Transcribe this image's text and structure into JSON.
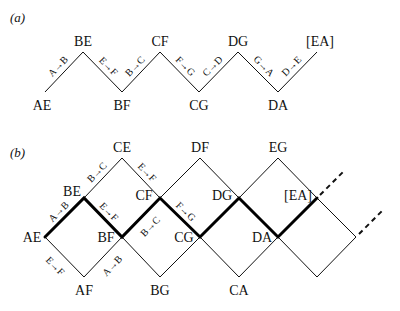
{
  "panel_a": {
    "label": "(a)",
    "nodes": [
      {
        "id": "AE",
        "label": "AE",
        "x": 45,
        "y": 92,
        "lx": 42,
        "ly": 110
      },
      {
        "id": "BE",
        "label": "BE",
        "x": 83,
        "y": 52,
        "lx": 83,
        "ly": 46
      },
      {
        "id": "BF",
        "label": "BF",
        "x": 122,
        "y": 92,
        "lx": 122,
        "ly": 110
      },
      {
        "id": "CF",
        "label": "CF",
        "x": 160,
        "y": 52,
        "lx": 160,
        "ly": 46
      },
      {
        "id": "CG",
        "label": "CG",
        "x": 199,
        "y": 92,
        "lx": 199,
        "ly": 110
      },
      {
        "id": "DG",
        "label": "DG",
        "x": 238,
        "y": 52,
        "lx": 238,
        "ly": 46
      },
      {
        "id": "DA",
        "label": "DA",
        "x": 278,
        "y": 92,
        "lx": 278,
        "ly": 110
      },
      {
        "id": "EA",
        "label": "[EA]",
        "x": 317,
        "y": 52,
        "lx": 320,
        "ly": 46
      }
    ],
    "edges": [
      {
        "label": "A→B",
        "from": "AE",
        "to": "BE"
      },
      {
        "label": "E→F",
        "from": "BE",
        "to": "BF"
      },
      {
        "label": "B→C",
        "from": "BF",
        "to": "CF"
      },
      {
        "label": "F→G",
        "from": "CF",
        "to": "CG"
      },
      {
        "label": "C→D",
        "from": "CG",
        "to": "DG"
      },
      {
        "label": "G→A",
        "from": "DG",
        "to": "DA"
      },
      {
        "label": "D→E",
        "from": "DA",
        "to": "EA"
      }
    ]
  },
  "panel_b": {
    "label": "(b)",
    "nodes": [
      {
        "id": "AE",
        "label": "AE",
        "x": 45,
        "y": 237,
        "lx": 32,
        "ly": 242,
        "anchor": "middle"
      },
      {
        "id": "BE",
        "label": "BE",
        "x": 84,
        "y": 198,
        "lx": 72,
        "ly": 196,
        "anchor": "middle"
      },
      {
        "id": "AF",
        "label": "AF",
        "x": 84,
        "y": 277,
        "lx": 84,
        "ly": 295,
        "anchor": "middle"
      },
      {
        "id": "CE",
        "label": "CE",
        "x": 122,
        "y": 158,
        "lx": 122,
        "ly": 152,
        "anchor": "middle"
      },
      {
        "id": "BF",
        "label": "BF",
        "x": 122,
        "y": 237,
        "lx": 106,
        "ly": 242,
        "anchor": "middle"
      },
      {
        "id": "CF",
        "label": "CF",
        "x": 160,
        "y": 198,
        "lx": 144,
        "ly": 200,
        "anchor": "middle"
      },
      {
        "id": "BG",
        "label": "BG",
        "x": 160,
        "y": 277,
        "lx": 160,
        "ly": 295,
        "anchor": "middle"
      },
      {
        "id": "DF",
        "label": "DF",
        "x": 200,
        "y": 158,
        "lx": 200,
        "ly": 152,
        "anchor": "middle"
      },
      {
        "id": "CG",
        "label": "CG",
        "x": 200,
        "y": 237,
        "lx": 184,
        "ly": 242,
        "anchor": "middle"
      },
      {
        "id": "DG",
        "label": "DG",
        "x": 239,
        "y": 198,
        "lx": 222,
        "ly": 200,
        "anchor": "middle"
      },
      {
        "id": "CA",
        "label": "CA",
        "x": 239,
        "y": 277,
        "lx": 239,
        "ly": 295,
        "anchor": "middle"
      },
      {
        "id": "EG",
        "label": "EG",
        "x": 278,
        "y": 158,
        "lx": 278,
        "ly": 152,
        "anchor": "middle"
      },
      {
        "id": "DA",
        "label": "DA",
        "x": 278,
        "y": 237,
        "lx": 262,
        "ly": 242,
        "anchor": "middle"
      },
      {
        "id": "EA",
        "label": "[EA]",
        "x": 317,
        "y": 198,
        "lx": 298,
        "ly": 200,
        "anchor": "middle"
      },
      {
        "id": "X1",
        "label": "",
        "x": 317,
        "y": 277,
        "lx": 0,
        "ly": 0,
        "anchor": "middle"
      },
      {
        "id": "X2",
        "label": "",
        "x": 356,
        "y": 237,
        "lx": 0,
        "ly": 0,
        "anchor": "middle"
      }
    ],
    "thin_edges": [
      [
        "AE",
        "AF"
      ],
      [
        "AF",
        "BF"
      ],
      [
        "BE",
        "CE"
      ],
      [
        "CE",
        "CF"
      ],
      [
        "BF",
        "BG"
      ],
      [
        "BG",
        "CG"
      ],
      [
        "CF",
        "DF"
      ],
      [
        "DF",
        "DG"
      ],
      [
        "CG",
        "CA"
      ],
      [
        "CA",
        "DA"
      ],
      [
        "DG",
        "EG"
      ],
      [
        "EG",
        "EA"
      ],
      [
        "DA",
        "X1"
      ],
      [
        "X1",
        "X2"
      ],
      [
        "EA",
        "X2"
      ]
    ],
    "thick_path": [
      "AE",
      "BE",
      "BF",
      "CF",
      "CG",
      "DG",
      "DA",
      "EA"
    ],
    "dashed": [
      {
        "x1": 320,
        "y1": 195,
        "x2": 343,
        "y2": 172
      },
      {
        "x1": 359,
        "y1": 234,
        "x2": 382,
        "y2": 211
      }
    ],
    "edge_labels": [
      {
        "label": "A→B",
        "from": "AE",
        "to": "BE",
        "side": "above"
      },
      {
        "label": "E→F",
        "from": "AE",
        "to": "AF",
        "side": "below"
      },
      {
        "label": "B→C",
        "from": "BE",
        "to": "CE",
        "side": "above"
      },
      {
        "label": "E→F",
        "from": "BE",
        "to": "BF",
        "side": "above"
      },
      {
        "label": "A→B",
        "from": "AF",
        "to": "BF",
        "side": "below"
      },
      {
        "label": "E→F",
        "from": "CE",
        "to": "CF",
        "side": "above"
      },
      {
        "label": "B→C",
        "from": "BF",
        "to": "CF",
        "side": "below"
      },
      {
        "label": "F→G",
        "from": "CF",
        "to": "CG",
        "side": "above"
      }
    ]
  }
}
